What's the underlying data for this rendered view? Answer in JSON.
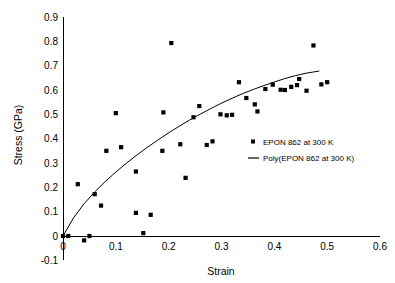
{
  "chart_data": {
    "type": "scatter",
    "title": "",
    "xlabel": "Strain",
    "ylabel": "Stress (GPa)",
    "xlim": [
      0,
      0.6
    ],
    "ylim": [
      -0.1,
      0.9
    ],
    "xticks": [
      "0",
      "0.1",
      "0.2",
      "0.3",
      "0.4",
      "0.5",
      "0.6"
    ],
    "xtick_values": [
      0,
      0.1,
      0.2,
      0.3,
      0.4,
      0.5,
      0.6
    ],
    "yticks": [
      "-0.1",
      "0",
      "0.1",
      "0.2",
      "0.3",
      "0.4",
      "0.5",
      "0.6",
      "0.7",
      "0.8",
      "0.9"
    ],
    "ytick_values": [
      -0.1,
      0,
      0.1,
      0.2,
      0.3,
      0.4,
      0.5,
      0.6,
      0.7,
      0.8,
      0.9
    ],
    "grid": false,
    "legend_position": "inside-right",
    "marker_color": "#000000",
    "line_color": "#000000",
    "series": [
      {
        "name": "EPON 862 at 300 K",
        "type": "scatter",
        "marker": "square",
        "points": [
          [
            0.0,
            0.0
          ],
          [
            0.01,
            0.0
          ],
          [
            0.028,
            0.213
          ],
          [
            0.04,
            -0.018
          ],
          [
            0.05,
            0.0
          ],
          [
            0.06,
            0.172
          ],
          [
            0.072,
            0.125
          ],
          [
            0.082,
            0.35
          ],
          [
            0.1,
            0.505
          ],
          [
            0.11,
            0.365
          ],
          [
            0.138,
            0.095
          ],
          [
            0.138,
            0.265
          ],
          [
            0.152,
            0.012
          ],
          [
            0.166,
            0.087
          ],
          [
            0.188,
            0.35
          ],
          [
            0.19,
            0.508
          ],
          [
            0.205,
            0.793
          ],
          [
            0.222,
            0.377
          ],
          [
            0.232,
            0.239
          ],
          [
            0.247,
            0.488
          ],
          [
            0.258,
            0.534
          ],
          [
            0.272,
            0.374
          ],
          [
            0.283,
            0.389
          ],
          [
            0.298,
            0.5
          ],
          [
            0.31,
            0.496
          ],
          [
            0.32,
            0.498
          ],
          [
            0.333,
            0.632
          ],
          [
            0.347,
            0.567
          ],
          [
            0.363,
            0.541
          ],
          [
            0.368,
            0.512
          ],
          [
            0.383,
            0.604
          ],
          [
            0.397,
            0.622
          ],
          [
            0.412,
            0.601
          ],
          [
            0.42,
            0.6
          ],
          [
            0.432,
            0.613
          ],
          [
            0.443,
            0.62
          ],
          [
            0.447,
            0.645
          ],
          [
            0.461,
            0.597
          ],
          [
            0.474,
            0.783
          ],
          [
            0.489,
            0.623
          ],
          [
            0.5,
            0.632
          ]
        ]
      },
      {
        "name": "Poly(EPON 862 at 300 K)",
        "type": "line",
        "points": [
          [
            0.0,
            0.0
          ],
          [
            0.02,
            0.075
          ],
          [
            0.04,
            0.133
          ],
          [
            0.06,
            0.181
          ],
          [
            0.08,
            0.224
          ],
          [
            0.1,
            0.263
          ],
          [
            0.12,
            0.299
          ],
          [
            0.14,
            0.333
          ],
          [
            0.16,
            0.365
          ],
          [
            0.18,
            0.395
          ],
          [
            0.2,
            0.424
          ],
          [
            0.22,
            0.451
          ],
          [
            0.24,
            0.477
          ],
          [
            0.26,
            0.501
          ],
          [
            0.28,
            0.524
          ],
          [
            0.3,
            0.546
          ],
          [
            0.32,
            0.566
          ],
          [
            0.34,
            0.585
          ],
          [
            0.36,
            0.602
          ],
          [
            0.38,
            0.618
          ],
          [
            0.4,
            0.633
          ],
          [
            0.42,
            0.647
          ],
          [
            0.44,
            0.659
          ],
          [
            0.46,
            0.669
          ],
          [
            0.485,
            0.678
          ]
        ]
      }
    ]
  },
  "legend": {
    "items": [
      {
        "label": "EPON 862 at 300 K",
        "glyph": "square-marker-icon"
      },
      {
        "label": "Poly(EPON 862 at 300 K)",
        "glyph": "line-segment-icon"
      }
    ]
  },
  "axes": {
    "x_title": "Strain",
    "y_title": "Stress (GPa)"
  }
}
